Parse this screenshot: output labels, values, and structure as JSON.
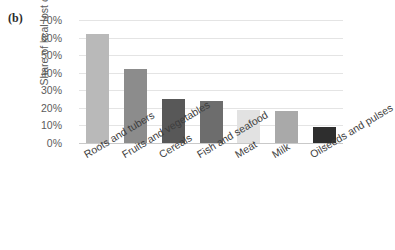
{
  "figure": {
    "panel_label": "(b)",
    "background": "#ffffff"
  },
  "axes": {
    "ylabel": "Share of kcal lost or waste",
    "ytick_labels": [
      "70%",
      "60%",
      "50%",
      "40%",
      "30%",
      "20%",
      "10%",
      "0%"
    ],
    "grid_color": "#e4e4e4",
    "axis_color": "#c9c9c9",
    "tick_text_color": "#5b5b5b",
    "category_text_color": "#3d3d3d"
  },
  "chart_data": {
    "type": "bar",
    "title": "",
    "xlabel": "",
    "ylabel": "Share of kcal lost or waste",
    "ylim": [
      0,
      70
    ],
    "ytick_values": [
      0,
      10,
      20,
      30,
      40,
      50,
      60,
      70
    ],
    "ytick_suffix": "%",
    "grid": true,
    "legend": "none",
    "categories": [
      "Roots and tubers",
      "Fruits and vegetables",
      "Cereals",
      "Fish and seafood",
      "Meat",
      "Milk",
      "Oilseeds and pulses"
    ],
    "values": [
      62,
      42,
      25,
      24,
      19,
      18,
      9
    ],
    "colors": [
      "#b9b9b9",
      "#8c8c8c",
      "#585858",
      "#6d6d6d",
      "#e2e2e2",
      "#a9a9a9",
      "#2e2e2e"
    ]
  }
}
